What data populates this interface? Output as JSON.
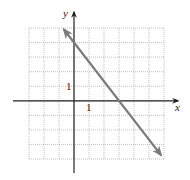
{
  "chart_data": {
    "type": "line",
    "title": "",
    "xlabel": "x",
    "ylabel": "y",
    "xlim": [
      -3,
      6
    ],
    "ylim": [
      -4,
      5
    ],
    "grid": true,
    "grid_step": 1,
    "tick_labels": {
      "x": [
        "1"
      ],
      "y": [
        "1"
      ]
    },
    "series": [
      {
        "name": "line",
        "equation": "y = -4/3 x + 4",
        "slope": -1.3333,
        "intercept": 4,
        "x_intercept": 3,
        "x": [
          -0.67,
          0,
          3,
          5.8
        ],
        "y": [
          4.9,
          4,
          0,
          -3.73
        ],
        "arrows": "both",
        "color": "#7a7a7a"
      }
    ]
  },
  "colors": {
    "axis": "#222222",
    "grid": "#b0b0b0",
    "line": "#7a7a7a"
  }
}
